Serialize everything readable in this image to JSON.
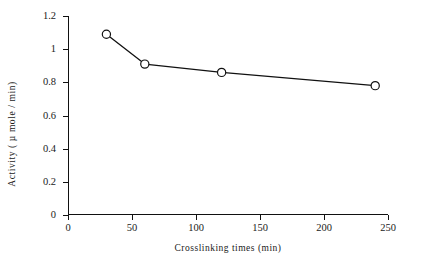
{
  "chart_data": {
    "type": "line",
    "title": "",
    "xlabel": "Crosslinking times (min)",
    "ylabel": "Activity ( µ mole / min)",
    "x": [
      30,
      60,
      120,
      240
    ],
    "values": [
      1.09,
      0.91,
      0.86,
      0.78
    ],
    "series": [
      {
        "name": "Activity",
        "x": [
          30,
          60,
          120,
          240
        ],
        "values": [
          1.09,
          0.91,
          0.86,
          0.78
        ]
      }
    ],
    "xlim": [
      0,
      250
    ],
    "ylim": [
      0,
      1.2
    ],
    "xticks": [
      0,
      50,
      100,
      150,
      200,
      250
    ],
    "xtick_labels": [
      "0",
      "50",
      "100",
      "150",
      "200",
      "250"
    ],
    "yticks": [
      0,
      0.2,
      0.4,
      0.6,
      0.8,
      1,
      1.2
    ],
    "ytick_labels": [
      "0",
      "0.2",
      "0.4",
      "0.6",
      "0.8",
      "1",
      "1.2"
    ],
    "grid": false,
    "legend": "none",
    "marker": "open-circle",
    "line_color": "#111111",
    "marker_fill": "#ffffff",
    "marker_stroke": "#111111"
  }
}
